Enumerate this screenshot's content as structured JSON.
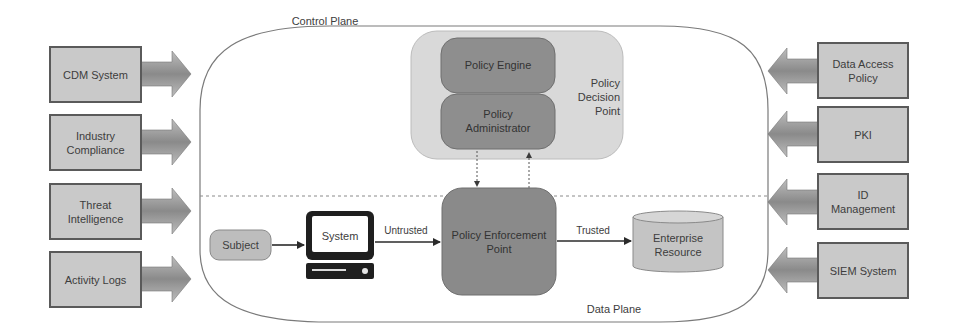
{
  "diagram": {
    "planes": {
      "control": "Control Plane",
      "data": "Data Plane"
    },
    "left_inputs": [
      {
        "label": "CDM System"
      },
      {
        "label": "Industry Compliance"
      },
      {
        "label": "Threat Intelligence"
      },
      {
        "label": "Activity Logs"
      }
    ],
    "right_inputs": [
      {
        "label": "Data Access Policy"
      },
      {
        "label": "PKI"
      },
      {
        "label": "ID Management"
      },
      {
        "label": "SIEM System"
      }
    ],
    "pdp": {
      "label": "Policy Decision Point",
      "engine": "Policy Engine",
      "administrator": "Policy Administrator"
    },
    "pep": {
      "label": "Policy Enforcement Point"
    },
    "subject": {
      "label": "Subject"
    },
    "system": {
      "label": "System"
    },
    "resource": {
      "label": "Enterprise Resource"
    },
    "edges": {
      "untrusted": "Untrusted",
      "trusted": "Trusted"
    },
    "colors": {
      "box_fill": "#c9c9c9",
      "pdp_fill": "#d9d9d9",
      "pe_fill": "#8e8e8e",
      "pep_fill": "#8a8a8a",
      "border": "#5a5a5a",
      "arrow_dark": "#6e6e6e",
      "arrow_light": "#b8b8b8"
    }
  }
}
